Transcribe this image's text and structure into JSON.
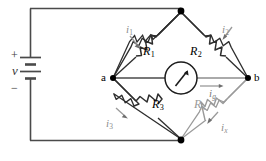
{
  "figure": {
    "type": "wheatstone-bridge-circuit",
    "background_color": "#ffffff",
    "wire_color": "#3c3c3c",
    "faint_color": "#9a9a9a",
    "label_gray": "#8c8c8c"
  },
  "source": {
    "name": "voltage-source",
    "plus_label": "+",
    "minus_label": "−",
    "voltage_label": "v",
    "cells": 2
  },
  "nodes": [
    {
      "id": "top",
      "label": "",
      "x": 181,
      "y": 12
    },
    {
      "id": "a",
      "label": "a",
      "x": 113,
      "y": 78
    },
    {
      "id": "b",
      "label": "b",
      "x": 248,
      "y": 78
    },
    {
      "id": "bottom",
      "label": "",
      "x": 181,
      "y": 139
    }
  ],
  "node_labels": {
    "a": "a",
    "b": "b"
  },
  "meter": {
    "name": "galvanometer",
    "cx": 181,
    "cy": 78,
    "r": 16
  },
  "resistors": [
    {
      "id": "R1",
      "base": "R",
      "sub": "1",
      "faint": false,
      "arm": "top-left"
    },
    {
      "id": "R2",
      "base": "R",
      "sub": "2",
      "faint": false,
      "arm": "top-right"
    },
    {
      "id": "R3",
      "base": "R",
      "sub": "3",
      "faint": false,
      "arm": "bottom-left"
    },
    {
      "id": "Rx",
      "base": "R",
      "sub": "x",
      "faint": true,
      "arm": "bottom-right"
    }
  ],
  "currents": [
    {
      "id": "i1",
      "base": "i",
      "sub": "1",
      "direction": "down-right",
      "arm": "top-left"
    },
    {
      "id": "i2",
      "base": "i",
      "sub": "2",
      "direction": "down-left",
      "arm": "top-right"
    },
    {
      "id": "i3",
      "base": "i",
      "sub": "3",
      "direction": "down-right",
      "arm": "bottom-left"
    },
    {
      "id": "ix",
      "base": "i",
      "sub": "x",
      "direction": "down-left",
      "arm": "bottom-right"
    },
    {
      "id": "ig",
      "base": "i",
      "sub": "g",
      "direction": "right",
      "arm": "bridge"
    }
  ]
}
